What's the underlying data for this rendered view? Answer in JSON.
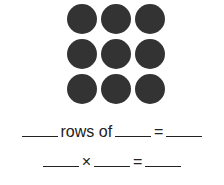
{
  "figure": {
    "rows": 3,
    "columns": 3,
    "dot_color": "#333333",
    "dots": [
      "dot",
      "dot",
      "dot",
      "dot",
      "dot",
      "dot",
      "dot",
      "dot",
      "dot"
    ]
  },
  "sentence1": {
    "rows_of": "rows of",
    "equals": "="
  },
  "sentence2": {
    "times": "×",
    "equals": "="
  }
}
